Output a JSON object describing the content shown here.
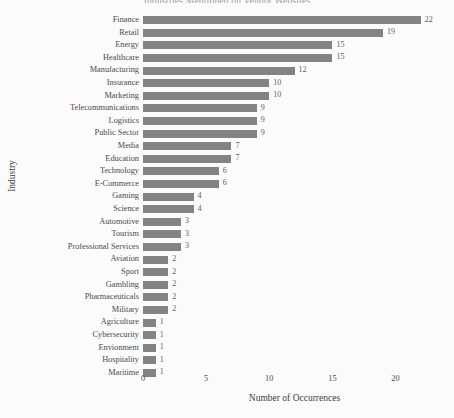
{
  "chart_data": {
    "type": "bar",
    "orientation": "horizontal",
    "title": "Industries Mentioned on Vendor Websites",
    "xlabel": "Number of Occurrences",
    "ylabel": "Industry",
    "xlim": [
      0,
      24
    ],
    "xticks": [
      0,
      5,
      10,
      15,
      20
    ],
    "xticklabels": [
      "0",
      "5",
      "10",
      "15",
      "20"
    ],
    "grid": false,
    "legend": null,
    "bar_color": "#838383",
    "background_color": "#fbfbfb",
    "categories": [
      "Finance",
      "Retail",
      "Energy",
      "Healthcare",
      "Manufacturing",
      "Insurance",
      "Marketing",
      "Telecommunications",
      "Logistics",
      "Public Sector",
      "Media",
      "Education",
      "Technology",
      "E-Commerce",
      "Gaming",
      "Science",
      "Automotive",
      "Tourism",
      "Professional Services",
      "Aviation",
      "Sport",
      "Gambling",
      "Pharmaceuticals",
      "Military",
      "Agriculture",
      "Cybersecurity",
      "Envionment",
      "Hospitality",
      "Maritime"
    ],
    "values": [
      22,
      19,
      15,
      15,
      12,
      10,
      10,
      9,
      9,
      9,
      7,
      7,
      6,
      6,
      4,
      4,
      3,
      3,
      3,
      2,
      2,
      2,
      2,
      2,
      1,
      1,
      1,
      1,
      1
    ],
    "value_labels": [
      "22",
      "19",
      "15",
      "15",
      "12",
      "10",
      "10",
      "9",
      "9",
      "9",
      "7",
      "7",
      "6",
      "6",
      "4",
      "4",
      "3",
      "3",
      "3",
      "2",
      "2",
      "2",
      "2",
      "2",
      "1",
      "1",
      "1",
      "1",
      "1"
    ]
  }
}
